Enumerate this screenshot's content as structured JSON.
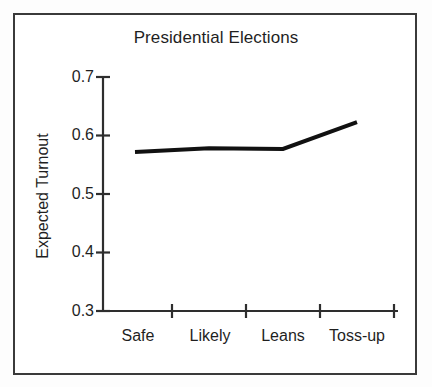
{
  "figure": {
    "border_color": "#3a3a3a",
    "background": "#ffffff",
    "line_color": "#111111"
  },
  "chart_data": {
    "type": "line",
    "title": "Presidential Elections",
    "xlabel": "",
    "ylabel": "Expected Turnout",
    "categories": [
      "Safe",
      "Likely",
      "Leans",
      "Toss-up"
    ],
    "values": [
      0.572,
      0.578,
      0.577,
      0.623
    ],
    "series": [
      {
        "name": "Expected Turnout",
        "values": [
          0.572,
          0.578,
          0.577,
          0.623
        ]
      }
    ],
    "ylim": [
      0.3,
      0.7
    ],
    "yticks": [
      0.3,
      0.4,
      0.5,
      0.6,
      0.7
    ],
    "ytick_labels": [
      "0.3",
      "0.4",
      "0.5",
      "0.6",
      "0.7"
    ],
    "xtick_labels": [
      "Safe",
      "Likely",
      "Leans",
      "Toss-up"
    ],
    "grid": false,
    "legend": false,
    "legend_position": "none",
    "line_width": 4,
    "markers": false
  },
  "axis": {
    "y_label_text": "Expected Turnout",
    "tick_0": "0.3",
    "tick_1": "0.4",
    "tick_2": "0.5",
    "tick_3": "0.6",
    "tick_4": "0.7"
  },
  "xaxis": {
    "cat_0": "Safe",
    "cat_1": "Likely",
    "cat_2": "Leans",
    "cat_3": "Toss-up"
  }
}
